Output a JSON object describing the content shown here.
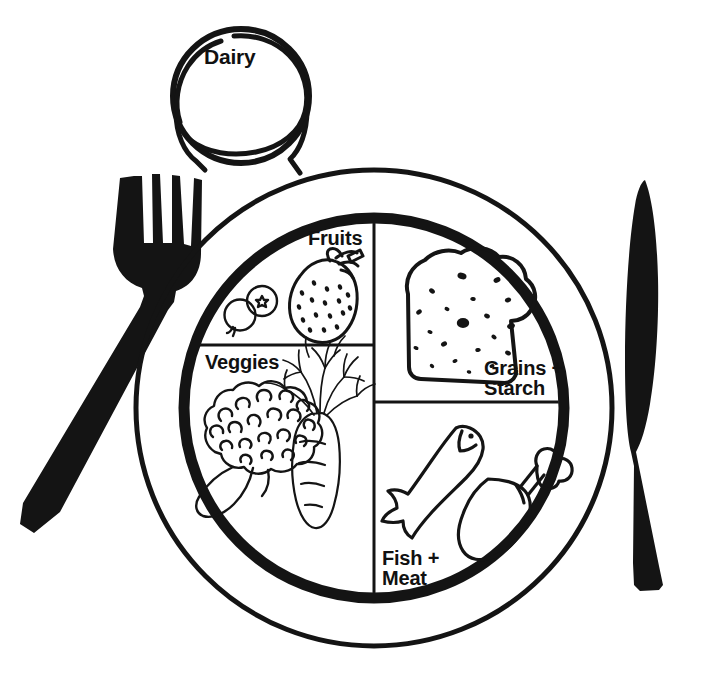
{
  "diagram": {
    "type": "healthy-plate-portion-guide",
    "background_color": "#ffffff",
    "line_color": "#111111",
    "labels": {
      "dairy": "Dairy",
      "fruits": "Fruits",
      "veggies": "Veggies",
      "grains": "Grains +\nStarch",
      "fish_meat": "Fish +\nMeat"
    },
    "place_setting": {
      "fork": {
        "name": "fork",
        "side": "left",
        "tines": 4,
        "fill": "#111111"
      },
      "knife": {
        "name": "knife",
        "side": "right",
        "fill": "#111111"
      },
      "glass": {
        "name": "drinking-glass",
        "position": "top-left",
        "label": "Dairy"
      },
      "plate": {
        "name": "plate",
        "rims": 2,
        "center_x": 374,
        "center_y": 408,
        "outer_radius": 238,
        "inner_radius": 190
      }
    },
    "sections": [
      {
        "id": "fruits",
        "label": "Fruits",
        "quadrant": "top-left",
        "share": "quarter",
        "foods": [
          "strawberry",
          "blueberries"
        ]
      },
      {
        "id": "veggies",
        "label": "Veggies",
        "quadrant": "bottom-left",
        "share": "quarter",
        "foods": [
          "broccoli",
          "carrot"
        ]
      },
      {
        "id": "grains",
        "label": "Grains + Starch",
        "quadrant": "top-right",
        "share": "quarter",
        "foods": [
          "bread-slice"
        ]
      },
      {
        "id": "fish_meat",
        "label": "Fish + Meat",
        "quadrant": "bottom-right",
        "share": "quarter",
        "foods": [
          "fish",
          "chicken-drumstick"
        ]
      }
    ]
  }
}
